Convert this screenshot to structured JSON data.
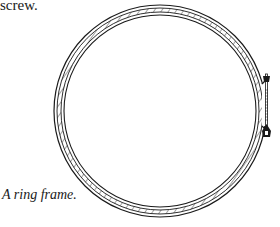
{
  "page": {
    "top_text": "screw.",
    "caption": "A ring frame.",
    "figure": {
      "subject": "embroidery ring frame with tightening screw",
      "stroke_color": "#1a1a1a",
      "background": "#ffffff"
    }
  }
}
